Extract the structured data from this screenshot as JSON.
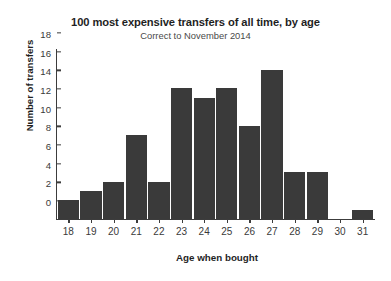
{
  "chart_data": {
    "type": "bar",
    "title": "100 most expensive transfers of all time, by age",
    "subtitle": "Correct to November 2014",
    "xlabel": "Age when bought",
    "ylabel": "Number of transfers",
    "categories": [
      18,
      19,
      20,
      21,
      22,
      23,
      24,
      25,
      26,
      27,
      28,
      29,
      30,
      31
    ],
    "values": [
      2,
      3,
      4,
      9,
      4,
      14,
      13,
      14,
      10,
      16,
      5,
      5,
      0,
      1
    ],
    "xlim": [
      17.5,
      31.5
    ],
    "ylim": [
      0,
      18
    ],
    "yticks": [
      0,
      2,
      4,
      6,
      8,
      10,
      12,
      14,
      16,
      18
    ],
    "xticks": [
      18,
      19,
      20,
      21,
      22,
      23,
      24,
      25,
      26,
      27,
      28,
      29,
      30,
      31
    ],
    "grid": false,
    "legend": null,
    "bar_color": "#3a3a3a",
    "background_color": "#ffffff",
    "axis_color": "#3c3c3c"
  }
}
